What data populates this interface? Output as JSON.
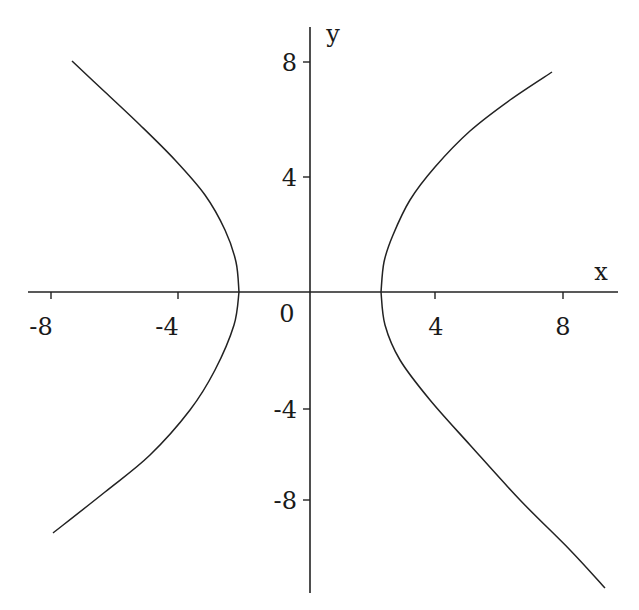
{
  "chart_data": {
    "type": "line",
    "title": "",
    "xlabel": "x",
    "ylabel": "y",
    "xlim": [
      -9,
      9.5
    ],
    "ylim": [
      -11.5,
      9.5
    ],
    "grid": false,
    "legend": null,
    "x_ticks": [
      "-8",
      "-4",
      "0",
      "4",
      "8"
    ],
    "y_ticks": [
      "8",
      "4",
      "-4",
      "-8"
    ],
    "origin_label": "0",
    "series": [
      {
        "name": "right-branch",
        "x": [
          2.2,
          2.4,
          3.3,
          5.0,
          7.6,
          9.3
        ],
        "y": [
          0,
          2.0,
          4.0,
          6.0,
          7.6,
          -10.3
        ]
      },
      {
        "name": "left-branch",
        "x": [
          -2.2,
          -2.6,
          -4.2,
          -7.4,
          -8.0
        ],
        "y": [
          0,
          3.0,
          4.6,
          8.0,
          -9.6
        ]
      }
    ],
    "points_pixel": {
      "right_upper": [
        [
          381,
          292
        ],
        [
          384,
          262
        ],
        [
          393,
          235
        ],
        [
          410,
          200
        ],
        [
          435,
          167
        ],
        [
          470,
          131
        ],
        [
          510,
          100
        ],
        [
          552,
          72
        ]
      ],
      "right_lower": [
        [
          381,
          292
        ],
        [
          385,
          325
        ],
        [
          400,
          360
        ],
        [
          430,
          400
        ],
        [
          470,
          445
        ],
        [
          520,
          500
        ],
        [
          570,
          550
        ],
        [
          605,
          588
        ]
      ],
      "left_upper": [
        [
          239,
          292
        ],
        [
          236,
          262
        ],
        [
          225,
          230
        ],
        [
          205,
          195
        ],
        [
          175,
          160
        ],
        [
          140,
          125
        ],
        [
          105,
          92
        ],
        [
          72,
          61
        ]
      ],
      "left_lower": [
        [
          239,
          292
        ],
        [
          234,
          325
        ],
        [
          215,
          370
        ],
        [
          190,
          410
        ],
        [
          150,
          455
        ],
        [
          105,
          492
        ],
        [
          53,
          533
        ]
      ]
    }
  }
}
